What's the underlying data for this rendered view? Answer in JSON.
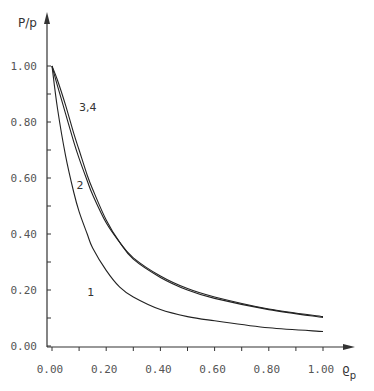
{
  "chart_data": {
    "type": "line",
    "title": "",
    "xlabel": "ϱp",
    "ylabel": "P/p",
    "xlim": [
      0,
      1.0
    ],
    "ylim": [
      0,
      1.0
    ],
    "grid": false,
    "legend": "none (curves labeled inline)",
    "x_ticks": [
      "0.00",
      "0.20",
      "0.40",
      "0.60",
      "0.80",
      "1.00"
    ],
    "y_ticks": [
      "0.00",
      "0.20",
      "0.40",
      "0.60",
      "0.80",
      "1.00"
    ],
    "series": [
      {
        "name": "1",
        "label_pos": [
          0.13,
          0.18
        ],
        "x": [
          0,
          0.02,
          0.05,
          0.08,
          0.1,
          0.13,
          0.15,
          0.2,
          0.25,
          0.3,
          0.4,
          0.5,
          0.6,
          0.8,
          1.0
        ],
        "values": [
          1.0,
          0.85,
          0.68,
          0.55,
          0.48,
          0.4,
          0.35,
          0.27,
          0.21,
          0.175,
          0.13,
          0.105,
          0.09,
          0.065,
          0.052
        ]
      },
      {
        "name": "2",
        "label_pos": [
          0.09,
          0.56
        ],
        "x": [
          0,
          0.02,
          0.05,
          0.08,
          0.1,
          0.13,
          0.15,
          0.2,
          0.25,
          0.3,
          0.4,
          0.5,
          0.6,
          0.8,
          1.0
        ],
        "values": [
          1.0,
          0.93,
          0.83,
          0.73,
          0.67,
          0.59,
          0.54,
          0.44,
          0.37,
          0.31,
          0.245,
          0.2,
          0.17,
          0.13,
          0.102
        ]
      },
      {
        "name": "3,4",
        "label_pos": [
          0.1,
          0.84
        ],
        "x": [
          0,
          0.02,
          0.05,
          0.08,
          0.1,
          0.13,
          0.15,
          0.2,
          0.25,
          0.3,
          0.4,
          0.5,
          0.6,
          0.8,
          1.0
        ],
        "values": [
          1.0,
          0.95,
          0.86,
          0.76,
          0.7,
          0.61,
          0.56,
          0.45,
          0.37,
          0.315,
          0.25,
          0.205,
          0.175,
          0.132,
          0.105
        ]
      }
    ]
  }
}
